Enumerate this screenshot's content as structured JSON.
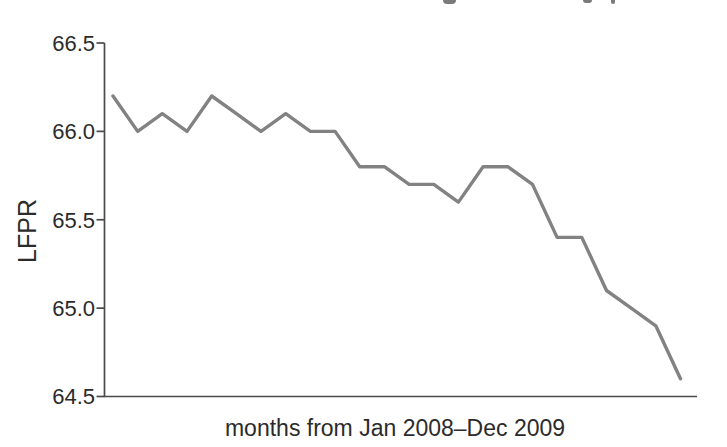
{
  "page": {
    "background_color": "#ffffff"
  },
  "chart_data": {
    "type": "line",
    "title": "",
    "xlabel": "months from Jan 2008–Dec 2009",
    "ylabel": "LFPR",
    "categories": [
      "Jan 2008",
      "Feb 2008",
      "Mar 2008",
      "Apr 2008",
      "May 2008",
      "Jun 2008",
      "Jul 2008",
      "Aug 2008",
      "Sep 2008",
      "Oct 2008",
      "Nov 2008",
      "Dec 2008",
      "Jan 2009",
      "Feb 2009",
      "Mar 2009",
      "Apr 2009",
      "May 2009",
      "Jun 2009",
      "Jul 2009",
      "Aug 2009",
      "Sep 2009",
      "Oct 2009",
      "Nov 2009",
      "Dec 2009"
    ],
    "series": [
      {
        "name": "LFPR",
        "values": [
          66.2,
          66.0,
          66.1,
          66.0,
          66.2,
          66.1,
          66.0,
          66.1,
          66.0,
          66.0,
          65.8,
          65.8,
          65.7,
          65.7,
          65.6,
          65.8,
          65.8,
          65.7,
          65.4,
          65.4,
          65.1,
          65.0,
          64.9,
          64.6
        ]
      }
    ],
    "ylim": [
      64.5,
      66.5
    ],
    "yticks": [
      66.5,
      66.0,
      65.5,
      65.0,
      64.5
    ],
    "ytick_labels": [
      "66.5",
      "66.0",
      "65.5",
      "65.0",
      "64.5"
    ],
    "xticks_visible": false,
    "grid": false,
    "legend": "none",
    "colors": {
      "line": "#828282",
      "axis": "#4a4a4a",
      "text": "#2b2b2b"
    }
  }
}
